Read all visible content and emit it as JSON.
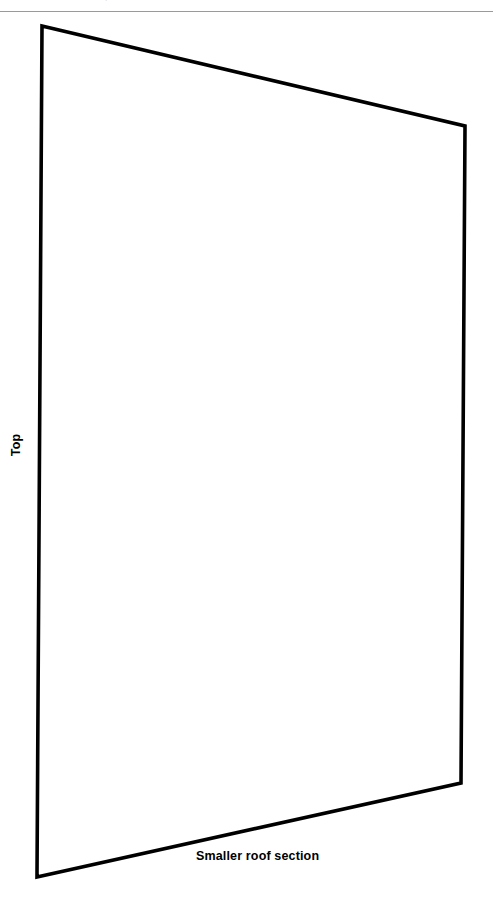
{
  "page": {
    "width": 493,
    "height": 898,
    "background_color": "#ffffff",
    "ink_color": "#000000",
    "rule_color": "#9a9a9a"
  },
  "header": {
    "rule_present": true,
    "artifact_glyph": "ˊ"
  },
  "figure": {
    "kind": "quadrilateral-outline",
    "description": "Smaller roof section",
    "stroke_color": "#000000",
    "stroke_width": 3.6,
    "fill": "none",
    "points": "42,26 465,126 461,783 37,877",
    "corners": [
      {
        "name": "top-left",
        "x": 42,
        "y": 26
      },
      {
        "name": "top-right",
        "x": 465,
        "y": 126
      },
      {
        "name": "bottom-right",
        "x": 461,
        "y": 783
      },
      {
        "name": "bottom-left",
        "x": 37,
        "y": 877
      }
    ]
  },
  "labels": {
    "left_edge": "Top",
    "bottom_edge": "Smaller roof section"
  }
}
